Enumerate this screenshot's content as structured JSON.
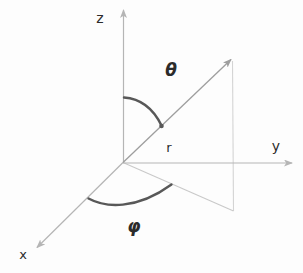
{
  "diagram": {
    "type": "spherical-coordinate-system",
    "labels": {
      "z_axis": "z",
      "y_axis": "y",
      "x_axis": "x",
      "radius": "r",
      "polar_angle": "θ",
      "azimuthal_angle": "φ"
    },
    "colors": {
      "background": "#fdfdfd",
      "axis": "#b5b5b5",
      "vector": "#9e9e9e",
      "projection": "#c9c9c9",
      "drop_line": "#d4d4d4",
      "angle_arc": "#585858",
      "label": "#2b2b2b"
    }
  }
}
